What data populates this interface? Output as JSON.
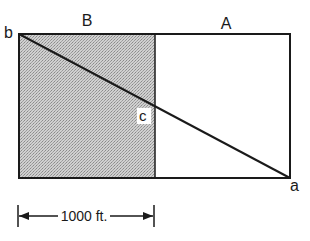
{
  "diagram": {
    "regions": [
      {
        "label": "B",
        "shaded": true
      },
      {
        "label": "A",
        "shaded": false
      }
    ],
    "points": [
      {
        "label": "b",
        "position": "top-left corner"
      },
      {
        "label": "c",
        "position": "intersection of diagonal and divider"
      },
      {
        "label": "a",
        "position": "bottom-right corner"
      }
    ],
    "dimension": {
      "label": "1000 ft.",
      "spans": "width of region B"
    },
    "colors": {
      "line": "#1a1a1a",
      "shade": "#bdbdbd",
      "background": "#ffffff"
    }
  }
}
